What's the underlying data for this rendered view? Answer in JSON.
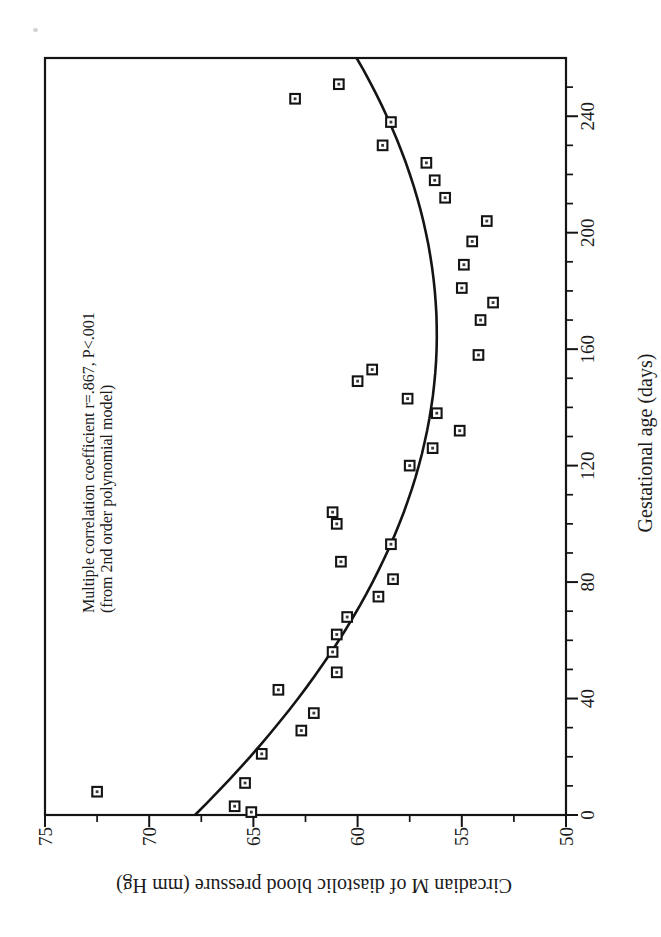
{
  "colors": {
    "ink": "#141414",
    "paper": "#ffffff",
    "dot": "#3a3a3a"
  },
  "chart_data": {
    "type": "scatter",
    "title": "",
    "xlabel": "Gestational age (days)",
    "ylabel": "Circadian M of diastolic blood pressure (mm Hg)",
    "annotation_line1": "Multiple correlation coefficient r=.867, P<.001",
    "annotation_line2": "(from 2nd order polynomial model)",
    "correlation_r": 0.867,
    "p_value": "P<.001",
    "model": "2nd order polynomial",
    "xlim": [
      0,
      260
    ],
    "ylim": [
      50,
      75
    ],
    "x_major_ticks": [
      0,
      40,
      80,
      120,
      160,
      200,
      240
    ],
    "x_minor_step": 10,
    "y_major_ticks": [
      75,
      70,
      65,
      60,
      55,
      50
    ],
    "y_minor_step": 2.5,
    "grid": false,
    "legend": "none",
    "page_rotation": "figure rotated 90deg counterclockwise on portrait page",
    "marker_style": "open square with center dot",
    "points": [
      [
        1,
        65.1
      ],
      [
        3,
        65.9
      ],
      [
        8,
        72.5
      ],
      [
        11,
        65.4
      ],
      [
        21,
        64.6
      ],
      [
        29,
        62.7
      ],
      [
        35,
        62.1
      ],
      [
        43,
        63.8
      ],
      [
        49,
        61.0
      ],
      [
        56,
        61.2
      ],
      [
        62,
        61.0
      ],
      [
        68,
        60.5
      ],
      [
        75,
        59.0
      ],
      [
        81,
        58.3
      ],
      [
        87,
        60.8
      ],
      [
        93,
        58.4
      ],
      [
        100,
        61.0
      ],
      [
        104,
        61.2
      ],
      [
        120,
        57.5
      ],
      [
        126,
        56.4
      ],
      [
        132,
        55.1
      ],
      [
        138,
        56.2
      ],
      [
        143,
        57.6
      ],
      [
        149,
        60.0
      ],
      [
        153,
        59.3
      ],
      [
        158,
        54.2
      ],
      [
        170,
        54.1
      ],
      [
        176,
        53.5
      ],
      [
        181,
        55.0
      ],
      [
        189,
        54.9
      ],
      [
        197,
        54.5
      ],
      [
        204,
        53.8
      ],
      [
        212,
        55.8
      ],
      [
        218,
        56.3
      ],
      [
        224,
        56.7
      ],
      [
        230,
        58.8
      ],
      [
        238,
        58.4
      ],
      [
        246,
        63.0
      ],
      [
        251,
        60.9
      ]
    ],
    "fit_curve": {
      "type": "quadratic",
      "coefficients": {
        "a": 67.8,
        "b": -0.14061,
        "c": 0.0004261
      },
      "domain": [
        0,
        260
      ]
    }
  }
}
